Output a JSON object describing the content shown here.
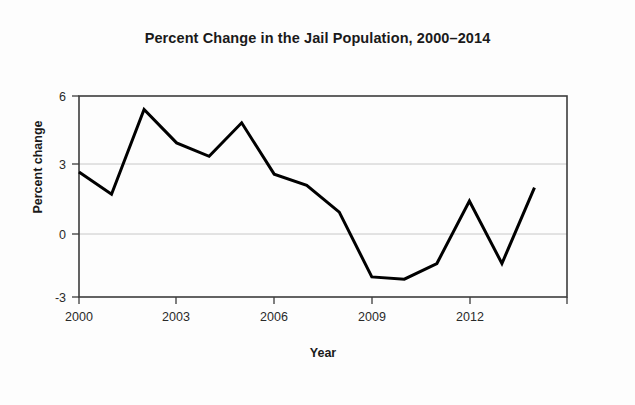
{
  "chart_data": {
    "type": "line",
    "title": "Percent Change in the Jail Population, 2000–2014",
    "xlabel": "Year",
    "ylabel": "Percent change",
    "x": [
      2000,
      2001,
      2002,
      2003,
      2004,
      2005,
      2006,
      2007,
      2008,
      2009,
      2010,
      2011,
      2012,
      2013,
      2014
    ],
    "values": [
      2.6,
      1.6,
      5.4,
      3.9,
      3.3,
      4.8,
      2.5,
      2.0,
      0.8,
      -2.1,
      -2.2,
      -1.5,
      1.3,
      -1.5,
      1.9
    ],
    "series": [
      {
        "name": "Percent change",
        "values": [
          2.6,
          1.6,
          5.4,
          3.9,
          3.3,
          4.8,
          2.5,
          2.0,
          0.8,
          -2.1,
          -2.2,
          -1.5,
          1.3,
          -1.5,
          1.9
        ],
        "color": "#000000"
      }
    ],
    "xlim": [
      2000,
      2015
    ],
    "ylim": [
      -3,
      6
    ],
    "x_ticks": [
      2000,
      2003,
      2006,
      2009,
      2012
    ],
    "x_tick_labels": [
      "2000",
      "2003",
      "2006",
      "2009",
      "2012"
    ],
    "y_ticks": [
      -3,
      0,
      3,
      6
    ],
    "y_tick_labels": [
      "-3",
      "0",
      "3",
      "6"
    ],
    "grid": "horizontal",
    "gridlines_at": [
      0,
      3
    ],
    "legend": "none",
    "colors": {
      "line": "#000000",
      "grid": "#c8c8c8",
      "frame": "#3c3c3c",
      "text": "#1a1a1a",
      "background": "#ffffff"
    }
  },
  "labels": {
    "title": "Percent Change in the Jail Population, 2000–2014",
    "x_axis": "Year",
    "y_axis": "Percent change",
    "x_tick_0": "2000",
    "x_tick_1": "2003",
    "x_tick_2": "2006",
    "x_tick_3": "2009",
    "x_tick_4": "2012",
    "y_tick_0": "6",
    "y_tick_1": "3",
    "y_tick_2": "0",
    "y_tick_3": "-3"
  }
}
